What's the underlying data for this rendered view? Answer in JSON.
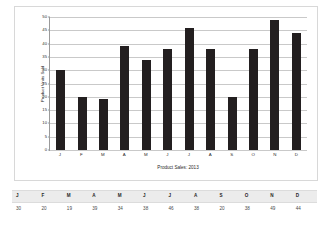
{
  "chart_data": {
    "type": "bar",
    "title": "",
    "xlabel": "Product Sales: 2013",
    "ylabel": "Product Units Sold",
    "categories": [
      "J",
      "F",
      "M",
      "A",
      "M",
      "J",
      "J",
      "A",
      "S",
      "O",
      "N",
      "D"
    ],
    "values": [
      30,
      20,
      19,
      39,
      34,
      38,
      46,
      38,
      20,
      38,
      49,
      44
    ],
    "ylim": [
      0,
      50
    ],
    "yticks": [
      0,
      5,
      10,
      15,
      20,
      25,
      30,
      35,
      40,
      45,
      50
    ],
    "ytick_labels": [
      "0",
      "5",
      "10",
      "15",
      "20",
      "25",
      "30",
      "35",
      "40",
      "45",
      "50"
    ],
    "grid": true,
    "legend": false,
    "bar_color": "#231f20"
  },
  "table": {
    "headers": [
      "J",
      "F",
      "M",
      "A",
      "M",
      "J",
      "J",
      "A",
      "S",
      "O",
      "N",
      "D"
    ],
    "values": [
      "30",
      "20",
      "19",
      "39",
      "34",
      "38",
      "46",
      "38",
      "20",
      "38",
      "49",
      "44"
    ],
    "header_bg": "#ececec"
  },
  "colors": {
    "bar": "#231f20",
    "gridline": "#c9c9c9",
    "axis": "#9a9a9a",
    "frame_border": "#d8d8d8",
    "background": "#ffffff"
  }
}
